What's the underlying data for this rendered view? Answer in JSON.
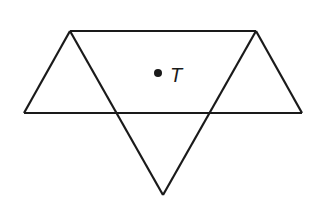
{
  "diagram": {
    "point_label": "T",
    "stroke_color": "#1a1a1a",
    "background": "#ffffff"
  }
}
